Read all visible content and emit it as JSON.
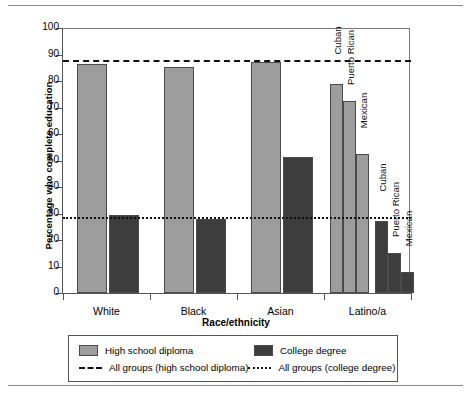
{
  "chart_data": {
    "type": "bar",
    "title": "",
    "xlabel": "Race/ethnicity",
    "ylabel": "Percentage who complete education",
    "ylim": [
      0,
      100
    ],
    "ytick_step": 10,
    "yticks": [
      0,
      10,
      20,
      30,
      40,
      50,
      60,
      70,
      80,
      90,
      100
    ],
    "grid": false,
    "legend_position": "below-axes",
    "categories": [
      "White",
      "Black",
      "Asian",
      "Latino/a"
    ],
    "series": [
      {
        "name": "High school diploma",
        "color": "#9d9d9d",
        "values": [
          86.5,
          85.2,
          87.0,
          null
        ]
      },
      {
        "name": "College degree",
        "color": "#3d3d3d",
        "values": [
          29.4,
          28.1,
          51.5,
          null
        ]
      }
    ],
    "subgroups": {
      "parent": "Latino/a",
      "names": [
        "Cuban",
        "Puerto Rican",
        "Mexican"
      ],
      "high_school_diploma": [
        79.0,
        72.5,
        52.5
      ],
      "college_degree": [
        27.0,
        15.2,
        8.0
      ]
    },
    "reference_lines": [
      {
        "label": "All groups (high school diploma)",
        "value": 87.0,
        "style": "dashed",
        "color": "#111111"
      },
      {
        "label": "All groups (college degree)",
        "value": 28.0,
        "style": "dotted",
        "color": "#111111"
      }
    ],
    "annotations": [
      "Cuban",
      "Puerto Rican",
      "Mexican",
      "Cuban",
      "Puerto Rican",
      "Mexican"
    ]
  },
  "legend": {
    "items": [
      {
        "label": "High school diploma",
        "marker": "swatch-light-gray"
      },
      {
        "label": "College degree",
        "marker": "swatch-dark-gray"
      },
      {
        "label": "All groups (high school diploma)",
        "marker": "dashed-line"
      },
      {
        "label": "All groups (college degree)",
        "marker": "dotted-line"
      }
    ]
  }
}
